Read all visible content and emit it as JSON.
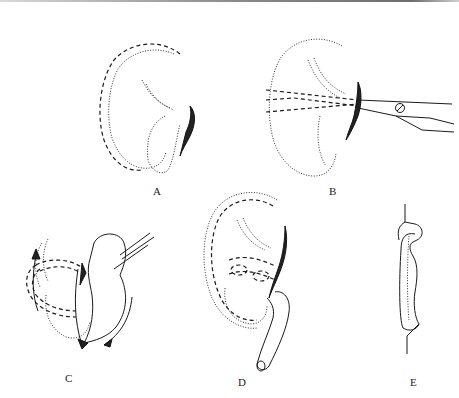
{
  "figure": {
    "type": "surgical-illustration",
    "panels": [
      {
        "id": "A",
        "label": "A",
        "description": "auricle outline with incision marked near helix/concha"
      },
      {
        "id": "B",
        "label": "B",
        "description": "scissors cutting through cartilage along incision"
      },
      {
        "id": "C",
        "label": "C",
        "description": "flap rotated with forceps, arrows indicating rotation"
      },
      {
        "id": "D",
        "label": "D",
        "description": "reconstructed ear with tube inserted"
      },
      {
        "id": "E",
        "label": "E",
        "description": "cross-section profile of flap"
      }
    ]
  },
  "colors": {
    "background": "#ffffff",
    "ink": "#1a1a1a",
    "top_rule": "#8a8a8a"
  }
}
